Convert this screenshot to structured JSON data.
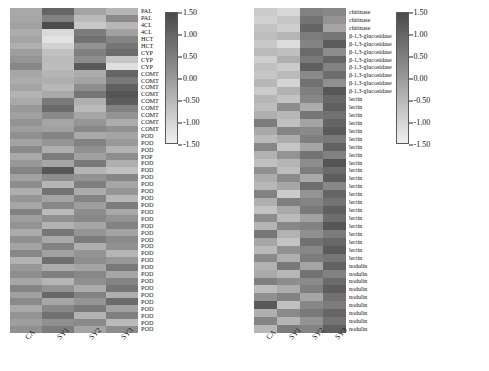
{
  "figure": {
    "background": "#ffffff",
    "panels": [
      "left",
      "right"
    ]
  },
  "colorbar": {
    "ticks": [
      "1.50",
      "1.00",
      "0.50",
      "0.00",
      "-0.50",
      "-1.00",
      "-1.50"
    ],
    "vmin": -1.5,
    "vmax": 1.5,
    "cmap": "grayscale-dark-high",
    "high_color": "#4a4a4a",
    "low_color": "#efefef"
  },
  "xaxis": {
    "ticks": [
      "CA",
      "SY1",
      "SY2",
      "SY3"
    ]
  },
  "chart_data": [
    {
      "type": "heatmap",
      "name": "phenylpropanoid-lignin-panel",
      "title": "",
      "xlabel": "",
      "ylabel": "",
      "columns": [
        "CA",
        "SY1",
        "SY2",
        "SY3"
      ],
      "rows": [
        "PAL",
        "PAL",
        "4CL",
        "4CL",
        "HCT",
        "HCT",
        "CYP",
        "CYP",
        "CYP",
        "COMT",
        "COMT",
        "COMT",
        "COMT",
        "COMT",
        "COMT",
        "COMT",
        "COMT",
        "COMT",
        "POD",
        "POD",
        "POD",
        "POP",
        "POD",
        "POD",
        "POD",
        "POD",
        "POD",
        "POD",
        "POD",
        "POD",
        "POD",
        "POD",
        "POD",
        "POD",
        "POD",
        "POD",
        "POD",
        "POD",
        "POD",
        "POD",
        "POD",
        "POD",
        "POD",
        "POD",
        "POD",
        "POD",
        "POD"
      ],
      "zlim": [
        -1.5,
        1.5
      ],
      "values": [
        [
          -0.25,
          0.95,
          -0.15,
          -0.45
        ],
        [
          -0.2,
          0.45,
          -0.55,
          0.3
        ],
        [
          -0.1,
          1.4,
          -0.8,
          -0.5
        ],
        [
          -0.3,
          -1.1,
          0.55,
          -0.1
        ],
        [
          -0.15,
          -1.25,
          0.75,
          0.4
        ],
        [
          -0.35,
          -0.95,
          0.15,
          0.65
        ],
        [
          -0.05,
          -0.65,
          0.5,
          0.85
        ],
        [
          0.1,
          -0.55,
          0.25,
          -0.75
        ],
        [
          0.35,
          -0.6,
          1.15,
          -1.2
        ],
        [
          -0.2,
          -0.45,
          -0.3,
          0.95
        ],
        [
          -0.3,
          -0.35,
          -0.15,
          0.6
        ],
        [
          -0.15,
          -0.5,
          0.25,
          1.05
        ],
        [
          -0.4,
          -0.25,
          0.65,
          1.25
        ],
        [
          -0.25,
          0.6,
          -0.35,
          1.1
        ],
        [
          0.05,
          0.85,
          -0.55,
          0.45
        ],
        [
          -0.1,
          0.3,
          -0.2,
          0.15
        ],
        [
          0.15,
          -0.2,
          0.1,
          -0.3
        ],
        [
          -0.05,
          -0.1,
          0.35,
          0.2
        ],
        [
          0.2,
          0.4,
          -0.25,
          -0.15
        ],
        [
          -0.15,
          0.1,
          0.45,
          0.05
        ],
        [
          0.3,
          -0.35,
          0.2,
          -0.4
        ],
        [
          -0.25,
          0.55,
          -0.1,
          0.25
        ],
        [
          0.05,
          -0.2,
          0.6,
          -0.35
        ],
        [
          0.4,
          1.2,
          -0.45,
          -0.65
        ],
        [
          -0.1,
          0.25,
          0.15,
          0.35
        ],
        [
          0.25,
          -0.45,
          0.5,
          -0.2
        ],
        [
          -0.35,
          0.7,
          -0.3,
          0.1
        ],
        [
          0.1,
          -0.15,
          0.4,
          -0.5
        ],
        [
          -0.2,
          0.35,
          -0.05,
          0.55
        ],
        [
          0.45,
          -0.55,
          0.25,
          -0.25
        ],
        [
          -0.05,
          0.2,
          0.35,
          0.15
        ],
        [
          0.15,
          -0.4,
          -0.2,
          0.45
        ],
        [
          -0.3,
          0.65,
          0.1,
          -0.15
        ],
        [
          0.2,
          -0.25,
          0.55,
          0.3
        ],
        [
          -0.15,
          0.45,
          -0.35,
          0.2
        ],
        [
          0.35,
          -0.1,
          0.15,
          -0.45
        ],
        [
          -0.4,
          0.8,
          0.25,
          0.05
        ],
        [
          0.05,
          -0.3,
          -0.15,
          0.6
        ],
        [
          0.25,
          0.5,
          0.35,
          -0.2
        ],
        [
          -0.2,
          -0.45,
          0.2,
          0.4
        ],
        [
          0.4,
          0.15,
          -0.3,
          0.65
        ],
        [
          -0.1,
          0.9,
          0.45,
          -0.35
        ],
        [
          0.3,
          -0.2,
          0.1,
          0.85
        ],
        [
          -0.25,
          0.35,
          0.6,
          -0.1
        ],
        [
          0.15,
          0.75,
          -0.4,
          0.5
        ],
        [
          -0.05,
          0.2,
          0.3,
          -0.55
        ],
        [
          0.2,
          0.55,
          -0.15,
          0.25
        ]
      ]
    },
    {
      "type": "heatmap",
      "name": "defense-related-panel",
      "title": "",
      "xlabel": "",
      "ylabel": "",
      "columns": [
        "CA",
        "SY1",
        "SY2",
        "SY3"
      ],
      "rows": [
        "chitinase",
        "chitinase",
        "chitinase",
        "β-1,3-glucosidase",
        "β-1,3-glucosidase",
        "β-1,3-glucosidase",
        "β-1,3-glucosidase",
        "β-1,3-glucosidase",
        "β-1,3-glucosidase",
        "β-1,3-glucosidase",
        "β-1,3-glucosidase",
        "lectin",
        "lectin",
        "lectin",
        "lectin",
        "lectin",
        "lectin",
        "lectin",
        "lectin",
        "lectin",
        "lectin",
        "lectin",
        "lectin",
        "lectin",
        "lectin",
        "lectin",
        "lectin",
        "lectin",
        "lectin",
        "lectin",
        "lectin",
        "lectin",
        "nodulin",
        "nodulin",
        "nodulin",
        "nodulin",
        "nodulin",
        "nodulin",
        "nodulin",
        "nodulin",
        "nodulin"
      ],
      "zlim": [
        -1.5,
        1.5
      ],
      "values": [
        [
          -0.85,
          -1.05,
          0.45,
          0.35
        ],
        [
          -0.95,
          -0.75,
          0.7,
          0.15
        ],
        [
          -0.7,
          -0.9,
          0.95,
          -0.2
        ],
        [
          -0.6,
          -0.45,
          0.55,
          0.65
        ],
        [
          -0.8,
          -1.15,
          0.4,
          1.1
        ],
        [
          -0.55,
          -0.65,
          0.85,
          0.25
        ],
        [
          -0.9,
          -0.35,
          0.6,
          0.95
        ],
        [
          -0.65,
          -0.85,
          1.05,
          0.45
        ],
        [
          -0.75,
          -0.55,
          0.3,
          0.8
        ],
        [
          -0.5,
          -1.0,
          0.75,
          0.2
        ],
        [
          -0.85,
          -0.4,
          0.5,
          1.2
        ],
        [
          -0.45,
          -0.7,
          0.35,
          0.9
        ],
        [
          -0.6,
          0.25,
          -0.3,
          1.05
        ],
        [
          -0.35,
          -0.5,
          0.65,
          0.75
        ],
        [
          0.55,
          -0.65,
          -0.15,
          0.95
        ],
        [
          -0.25,
          0.4,
          0.3,
          1.15
        ],
        [
          -0.55,
          -0.3,
          0.5,
          0.6
        ],
        [
          0.35,
          -0.75,
          -0.2,
          1.0
        ],
        [
          -0.4,
          0.15,
          0.7,
          0.45
        ],
        [
          -0.65,
          -0.45,
          0.25,
          1.25
        ],
        [
          0.2,
          -0.6,
          0.55,
          0.85
        ],
        [
          -0.3,
          0.3,
          -0.25,
          1.1
        ],
        [
          -0.5,
          -0.2,
          0.8,
          0.35
        ],
        [
          0.45,
          -0.85,
          0.15,
          0.95
        ],
        [
          -0.35,
          0.5,
          0.4,
          0.7
        ],
        [
          -0.7,
          -0.25,
          0.6,
          1.05
        ],
        [
          0.25,
          -0.55,
          -0.1,
          0.8
        ],
        [
          -0.45,
          0.35,
          0.45,
          1.2
        ],
        [
          0.65,
          -0.4,
          0.2,
          0.55
        ],
        [
          -0.2,
          -0.7,
          0.75,
          0.9
        ],
        [
          -0.55,
          0.2,
          0.35,
          1.15
        ],
        [
          0.3,
          -0.35,
          0.55,
          0.65
        ],
        [
          -0.4,
          0.6,
          -0.15,
          1.0
        ],
        [
          -0.25,
          -0.5,
          0.7,
          0.45
        ],
        [
          0.5,
          0.25,
          0.3,
          0.85
        ],
        [
          -0.6,
          -0.3,
          0.5,
          1.1
        ],
        [
          0.2,
          0.45,
          -0.2,
          0.75
        ],
        [
          1.15,
          -0.65,
          0.35,
          0.55
        ],
        [
          -0.35,
          0.3,
          0.6,
          0.95
        ],
        [
          0.4,
          -0.45,
          0.15,
          0.7
        ],
        [
          -0.5,
          0.55,
          0.4,
          1.05
        ]
      ]
    }
  ]
}
